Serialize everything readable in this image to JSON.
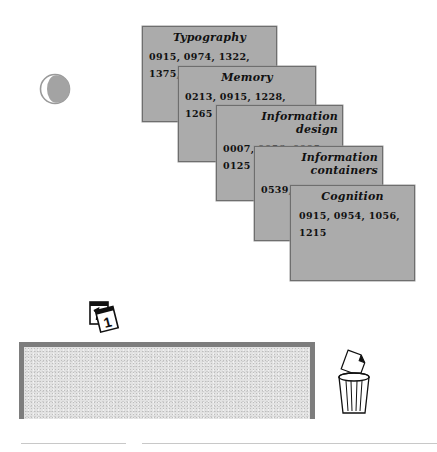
{
  "cards": [
    {
      "title": "Typography",
      "refs": "0915, 0974, 1322, 1375, 1387"
    },
    {
      "title": "Memory",
      "refs": "0213, 0915, 1228, 1265 1377"
    },
    {
      "title": "Information design",
      "refs": "0007, 0056, 0095, 0125 0915"
    },
    {
      "title": "Information containers",
      "refs": "0539, 0915"
    },
    {
      "title": "Cognition",
      "refs": "0915, 0954, 1056, 1215"
    }
  ],
  "icons": {
    "moon": "moon-phase-icon",
    "calendar": "calendar-icon",
    "trash": "trash-can-icon"
  },
  "calendar": {
    "day": "1"
  },
  "colors": {
    "card_fill": "#ababab",
    "card_border": "#6e6e6e",
    "tray_border": "#7d7d7d",
    "tray_fill": "#e2e2e2"
  }
}
